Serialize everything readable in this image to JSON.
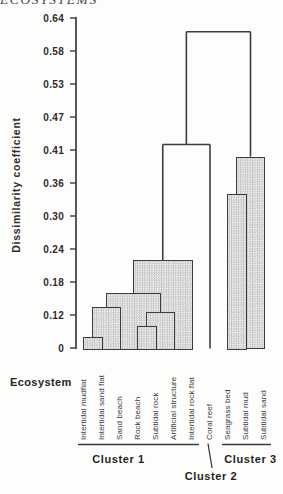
{
  "page_header": "ECOSYSTEMS",
  "axis": {
    "y_title": "Dissimilarity coefficient",
    "x_title": "Ecosystem",
    "tick_labels_top_to_bottom": [
      "0.64",
      "0.58",
      "0.53",
      "0.47",
      "0.41",
      "0.36",
      "0.30",
      "0.24",
      "0.18",
      "0.12",
      "0"
    ]
  },
  "chart_data": {
    "type": "dendrogram",
    "title": "",
    "xlabel": "Ecosystem",
    "ylabel": "Dissimilarity coefficient",
    "y_ticks": [
      0,
      0.12,
      0.18,
      0.24,
      0.3,
      0.36,
      0.41,
      0.47,
      0.53,
      0.58,
      0.64
    ],
    "ylim": [
      0,
      0.64
    ],
    "grid": false,
    "leaves": [
      "Intertidal mudflat",
      "Intertidal sand flat",
      "Sand beach",
      "Rock beach",
      "Subtidal rock",
      "Artificial structure",
      "Intertidal rock flat",
      "Coral reef",
      "Seagrass bed",
      "Subtidal mud",
      "Subtidal sand"
    ],
    "merges": [
      {
        "id": "m1",
        "left": "L0",
        "right": "L1",
        "height": 0.04,
        "style": "bar",
        "note": "Intertidal mudflat + Intertidal sand flat"
      },
      {
        "id": "m2",
        "left": "m1",
        "right": "L2",
        "height": 0.135,
        "style": "bar",
        "note": "+ Sand beach"
      },
      {
        "id": "m3",
        "left": "L3",
        "right": "L4",
        "height": 0.08,
        "style": "bar",
        "note": "Rock beach + Subtidal rock"
      },
      {
        "id": "m4",
        "left": "m3",
        "right": "L5",
        "height": 0.125,
        "style": "bar",
        "note": "+ Artificial structure"
      },
      {
        "id": "m5",
        "left": "m2",
        "right": "m4",
        "height": 0.16,
        "style": "bar",
        "note": "join of beach/rock groups"
      },
      {
        "id": "m6",
        "left": "m5",
        "right": "L6",
        "height": 0.22,
        "style": "bar",
        "note": "+ Intertidal rock flat"
      },
      {
        "id": "m7",
        "left": "m6",
        "right": "L7",
        "height": 0.42,
        "style": "bracket",
        "note": "+ Coral reef"
      },
      {
        "id": "m8",
        "left": "L8",
        "right": "L9",
        "height": 0.34,
        "style": "bar",
        "note": "Seagrass bed + Subtidal mud"
      },
      {
        "id": "m9",
        "left": "m8",
        "right": "L10",
        "height": 0.4,
        "style": "bar",
        "note": "+ Subtidal sand"
      },
      {
        "id": "m10",
        "left": "m7",
        "right": "m9",
        "height": 0.615,
        "style": "bracket",
        "note": "root"
      }
    ],
    "clusters": [
      {
        "label": "Cluster 1",
        "leaf_from": 0,
        "leaf_to": 6
      },
      {
        "label": "Cluster 2",
        "leaf_from": 7,
        "leaf_to": 7
      },
      {
        "label": "Cluster 3",
        "leaf_from": 8,
        "leaf_to": 10
      }
    ]
  }
}
